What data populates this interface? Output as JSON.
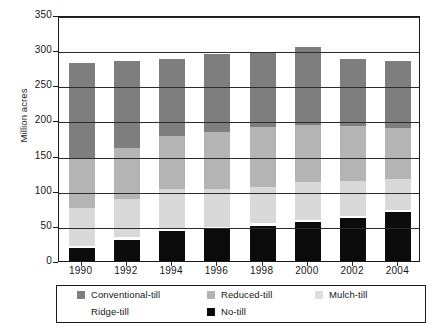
{
  "chart_data": {
    "type": "bar",
    "subtype": "stacked-bar",
    "title": "",
    "xlabel": "",
    "ylabel": "Million acres",
    "ylim": [
      0,
      350
    ],
    "ytick_step": 50,
    "yticks": [
      0,
      50,
      100,
      150,
      200,
      250,
      300,
      350
    ],
    "grid": true,
    "grid_axis": "y",
    "legend_position": "bottom",
    "categories": [
      "1990",
      "1992",
      "1994",
      "1996",
      "1998",
      "2000",
      "2002",
      "2004"
    ],
    "stack_order_bottom_to_top": [
      "No-till",
      "Ridge-till",
      "Mulch-till",
      "Reduced-till",
      "Conventional-till"
    ],
    "series": [
      {
        "name": "No-till",
        "color": "#0b0b0b",
        "values": [
          18,
          30,
          42,
          45,
          50,
          56,
          61,
          70
        ]
      },
      {
        "name": "Ridge-till",
        "color": "#fdfdfd",
        "values": [
          3,
          4,
          4,
          4,
          4,
          3,
          3,
          3
        ]
      },
      {
        "name": "Mulch-till",
        "color": "#d9d9d9",
        "values": [
          55,
          54,
          57,
          54,
          52,
          53,
          50,
          44
        ]
      },
      {
        "name": "Reduced-till",
        "color": "#b4b4b4",
        "values": [
          70,
          73,
          75,
          80,
          85,
          82,
          78,
          73
        ]
      },
      {
        "name": "Conventional-till",
        "color": "#7e7e7e",
        "values": [
          136,
          124,
          110,
          112,
          105,
          111,
          96,
          94
        ]
      }
    ],
    "totals": [
      282,
      285,
      288,
      295,
      296,
      305,
      288,
      284
    ]
  },
  "axis": {
    "ylabel": "Million acres",
    "ytick_labels": [
      "350",
      "300",
      "250",
      "200",
      "150",
      "100",
      "50",
      "0"
    ],
    "xtick_labels": [
      "1990",
      "1992",
      "1994",
      "1996",
      "1998",
      "2000",
      "2002",
      "2004"
    ]
  },
  "legend": {
    "row1": [
      {
        "label": "Conventional-till",
        "swatch": "sw-conv",
        "icon": "legend-swatch-conventional-till"
      },
      {
        "label": "Reduced-till",
        "swatch": "sw-reduced",
        "icon": "legend-swatch-reduced-till"
      },
      {
        "label": "Mulch-till",
        "swatch": "sw-mulch",
        "icon": "legend-swatch-mulch-till"
      }
    ],
    "row2": [
      {
        "label": "Ridge-till",
        "swatch": "sw-ridge",
        "icon": "legend-swatch-ridge-till"
      },
      {
        "label": "No-till",
        "swatch": "sw-no",
        "icon": "legend-swatch-no-till"
      }
    ]
  },
  "colors": {
    "conventional_till": "#7e7e7e",
    "reduced_till": "#b4b4b4",
    "mulch_till": "#d9d9d9",
    "ridge_till": "#fdfdfd",
    "no_till": "#0b0b0b",
    "axis": "#1a1a1a",
    "background": "#ffffff"
  }
}
